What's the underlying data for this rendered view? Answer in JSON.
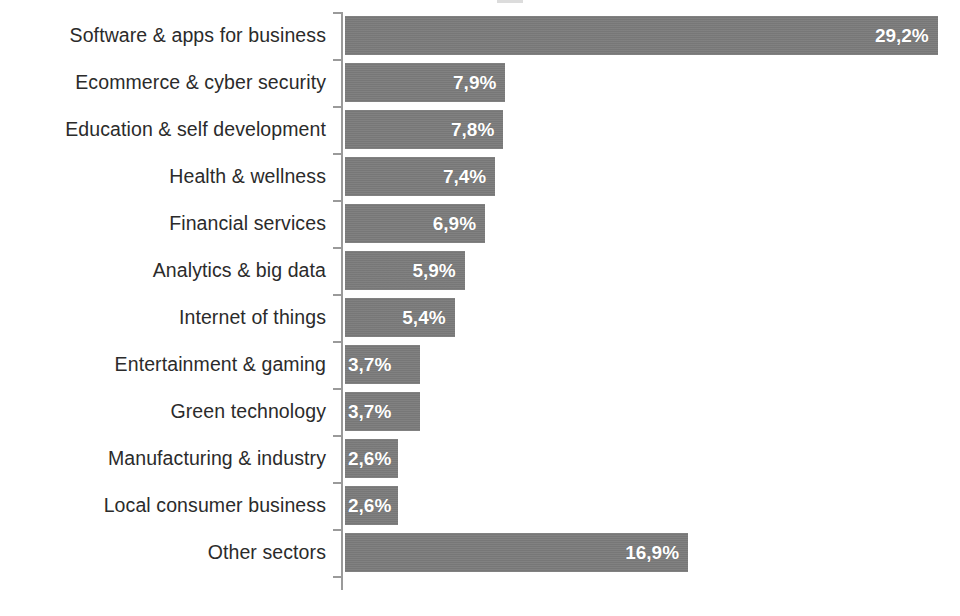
{
  "chart_data": {
    "type": "bar",
    "orientation": "horizontal",
    "title": "",
    "xlabel": "",
    "ylabel": "",
    "xlim": [
      0,
      30.3
    ],
    "grid": false,
    "legend": false,
    "value_suffix": "%",
    "decimal_separator": ",",
    "categories": [
      "Software & apps for business",
      "Ecommerce & cyber security",
      "Education & self development",
      "Health & wellness",
      "Financial services",
      "Analytics & big data",
      "Internet of things",
      "Entertainment & gaming",
      "Green technology",
      "Manufacturing & industry",
      "Local consumer business",
      "Other sectors"
    ],
    "values": [
      29.2,
      7.9,
      7.8,
      7.4,
      6.9,
      5.9,
      5.4,
      3.7,
      3.7,
      2.6,
      2.6,
      16.9
    ],
    "value_labels": [
      "29,2%",
      "7,9%",
      "7,8%",
      "7,4%",
      "6,9%",
      "5,9%",
      "5,4%",
      "3,7%",
      "3,7%",
      "2,6%",
      "2,6%",
      "16,9%"
    ]
  },
  "style": {
    "bar_color": "#7b7b7b",
    "label_color": "#2b2b2b",
    "value_color": "#ffffff",
    "axis_color": "#9a9a9a",
    "background": "#ffffff"
  }
}
